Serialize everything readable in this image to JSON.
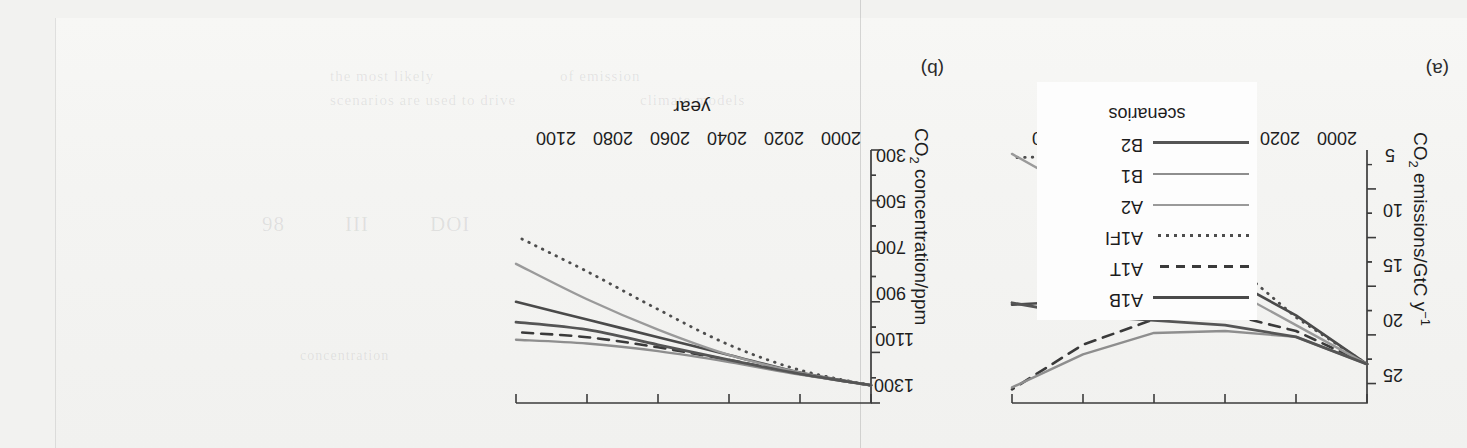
{
  "figure": {
    "panels": [
      {
        "label": "(a)",
        "x_axis_title": "year",
        "y_axis_title_parts": {
          "pre": "CO",
          "sub": "2",
          "post": " emissions/GtC y",
          "sup": "−1"
        },
        "y_axis_title_text": "CO2 emissions/GtC y−1",
        "x_ticks": [
          "2000",
          "2020",
          "2040",
          "2060",
          "2080",
          "2100"
        ],
        "y_ticks": [
          "5",
          "10",
          "15",
          "20",
          "25"
        ]
      },
      {
        "label": "(b)",
        "x_axis_title": "year",
        "y_axis_title_parts": {
          "pre": "CO",
          "sub": "2",
          "post": " concentration/ppm",
          "sup": ""
        },
        "y_axis_title_text": "CO2 concentration/ppm",
        "x_ticks": [
          "2000",
          "2020",
          "2040",
          "2060",
          "2080",
          "2100"
        ],
        "y_ticks": [
          "300",
          "500",
          "700",
          "900",
          "1100",
          "1300"
        ]
      }
    ]
  },
  "legend": {
    "title": "scenarios",
    "items": [
      {
        "label": "A1B",
        "style": "solid",
        "color": "#4a4a4a",
        "width": 2.6
      },
      {
        "label": "A1T",
        "style": "dashed",
        "color": "#3a3a3a",
        "width": 2.6
      },
      {
        "label": "A1FI",
        "style": "dotted",
        "color": "#4d4d4d",
        "width": 2.8
      },
      {
        "label": "A2",
        "style": "solid",
        "color": "#9a9a9a",
        "width": 2.4
      },
      {
        "label": "B1",
        "style": "solid",
        "color": "#8e8e8e",
        "width": 2.4
      },
      {
        "label": "B2",
        "style": "solid",
        "color": "#555555",
        "width": 2.8
      }
    ]
  },
  "bleed_text": [
    {
      "text": "the  most  likely",
      "x": 330,
      "y": 68,
      "size": 15
    },
    {
      "text": "of  emission",
      "x": 560,
      "y": 68,
      "size": 15
    },
    {
      "text": "scenarios  are  used  to  drive",
      "x": 330,
      "y": 92,
      "size": 15
    },
    {
      "text": "climate  models",
      "x": 640,
      "y": 92,
      "size": 15
    },
    {
      "text": "DOI",
      "x": 430,
      "y": 212,
      "size": 21
    },
    {
      "text": "III",
      "x": 345,
      "y": 212,
      "size": 21
    },
    {
      "text": "98",
      "x": 262,
      "y": 212,
      "size": 21
    },
    {
      "text": "concentration",
      "x": 300,
      "y": 348,
      "size": 14
    }
  ],
  "chart_data": [
    {
      "type": "line",
      "title": "(a)",
      "xlabel": "year",
      "ylabel": "CO2 emissions/GtC y−1",
      "xlim": [
        2000,
        2100
      ],
      "ylim": [
        3,
        29
      ],
      "xticks": [
        2000,
        2020,
        2040,
        2060,
        2080,
        2100
      ],
      "yticks": [
        5,
        10,
        15,
        20,
        25
      ],
      "grid": false,
      "legend_position": "external-left",
      "x": [
        2000,
        2020,
        2040,
        2060,
        2080,
        2100
      ],
      "series": [
        {
          "name": "A1B",
          "values": [
            7.0,
            12.0,
            16.0,
            16.0,
            13.5,
            13.1
          ]
        },
        {
          "name": "A1T",
          "values": [
            7.0,
            10.4,
            12.2,
            11.6,
            9.0,
            4.4
          ]
        },
        {
          "name": "A1FI",
          "values": [
            7.0,
            11.8,
            18.0,
            23.5,
            28.4,
            28.2
          ]
        },
        {
          "name": "A2",
          "values": [
            7.0,
            11.0,
            15.0,
            20.0,
            24.5,
            28.6
          ]
        },
        {
          "name": "B1",
          "values": [
            7.0,
            9.8,
            10.4,
            10.2,
            8.0,
            4.6
          ]
        },
        {
          "name": "B2",
          "values": [
            7.0,
            9.8,
            11.0,
            11.5,
            12.0,
            13.3
          ]
        }
      ]
    },
    {
      "type": "line",
      "title": "(b)",
      "xlabel": "year",
      "ylabel": "CO2 concentration/ppm",
      "xlim": [
        2000,
        2100
      ],
      "ylim": [
        300,
        1300
      ],
      "xticks": [
        2000,
        2020,
        2040,
        2060,
        2080,
        2100
      ],
      "yticks": [
        300,
        500,
        700,
        900,
        1100,
        1300
      ],
      "grid": false,
      "legend_position": "external-left",
      "x": [
        2000,
        2020,
        2040,
        2060,
        2080,
        2100
      ],
      "series": [
        {
          "name": "A1B",
          "values": [
            370,
            420,
            490,
            560,
            630,
            700
          ]
        },
        {
          "name": "A1T",
          "values": [
            370,
            415,
            470,
            520,
            560,
            580
          ]
        },
        {
          "name": "A1FI",
          "values": [
            370,
            430,
            530,
            670,
            820,
            960
          ]
        },
        {
          "name": "A2",
          "values": [
            370,
            420,
            490,
            590,
            710,
            850
          ]
        },
        {
          "name": "B1",
          "values": [
            370,
            412,
            462,
            505,
            535,
            550
          ]
        },
        {
          "name": "B2",
          "values": [
            370,
            415,
            470,
            530,
            590,
            620
          ]
        }
      ]
    }
  ]
}
